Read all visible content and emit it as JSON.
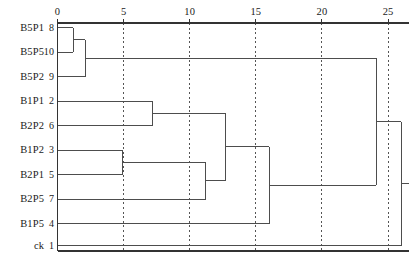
{
  "figure": {
    "title": "",
    "caption": "",
    "side_note": ""
  },
  "axis": {
    "label": "",
    "ticks": [
      0,
      5,
      10,
      15,
      20,
      25
    ],
    "tick_labels": [
      "0",
      "5",
      "10",
      "15",
      "20",
      "25"
    ],
    "range": [
      0,
      26.6
    ],
    "position": "top",
    "grid": "dashed-vertical"
  },
  "leaves": [
    {
      "name": "B5P1",
      "id": "8"
    },
    {
      "name": "B5P5",
      "id": "10"
    },
    {
      "name": "B5P2",
      "id": "9"
    },
    {
      "name": "B1P1",
      "id": "2"
    },
    {
      "name": "B2P2",
      "id": "6"
    },
    {
      "name": "B1P2",
      "id": "3"
    },
    {
      "name": "B2P1",
      "id": "5"
    },
    {
      "name": "B2P5",
      "id": "7"
    },
    {
      "name": "B1P5",
      "id": "4"
    },
    {
      "name": "ck",
      "id": "1"
    }
  ],
  "colors": {
    "line": "#4d4d4d",
    "grid": "#555555",
    "axis": "#333333",
    "background": "#ffffff"
  },
  "chart_data": {
    "type": "dendrogram",
    "title": "",
    "xlabel": "",
    "ylabel": "",
    "xlim": [
      0,
      26.6
    ],
    "grid": true,
    "orientation": "horizontal",
    "categories": [
      "B5P1",
      "B5P5",
      "B5P2",
      "B1P1",
      "B2P2",
      "B1P2",
      "B2P1",
      "B2P5",
      "B1P5",
      "ck"
    ],
    "leaf_ids": [
      8,
      10,
      9,
      2,
      6,
      3,
      5,
      7,
      4,
      1
    ],
    "merges": [
      {
        "step": 1,
        "members": [
          "B5P1",
          "B5P5"
        ],
        "distance": 1.2
      },
      {
        "step": 2,
        "members": [
          "B1P2",
          "B2P1"
        ],
        "distance": 4.9
      },
      {
        "step": 3,
        "members": [
          "B5P1",
          "B5P5",
          "B5P2"
        ],
        "distance": 2.1
      },
      {
        "step": 4,
        "members": [
          "B1P1",
          "B2P2"
        ],
        "distance": 7.2
      },
      {
        "step": 5,
        "members": [
          "B1P2",
          "B2P1",
          "B2P5"
        ],
        "distance": 11.2
      },
      {
        "step": 6,
        "members": [
          "B1P1",
          "B2P2",
          "B1P2",
          "B2P1",
          "B2P5"
        ],
        "distance": 12.7
      },
      {
        "step": 7,
        "members": [
          "B1P1",
          "B2P2",
          "B1P2",
          "B2P1",
          "B2P5",
          "B1P5"
        ],
        "distance": 16.0
      },
      {
        "step": 8,
        "members": [
          "B5P1",
          "B5P5",
          "B5P2",
          "B1P1",
          "B2P2",
          "B1P2",
          "B2P1",
          "B2P5",
          "B1P5"
        ],
        "distance": 24.1
      },
      {
        "step": 9,
        "members": [
          "B5P1",
          "B5P5",
          "B5P2",
          "B1P1",
          "B2P2",
          "B1P2",
          "B2P1",
          "B2P5",
          "B1P5",
          "ck"
        ],
        "distance": 26.0
      }
    ]
  }
}
